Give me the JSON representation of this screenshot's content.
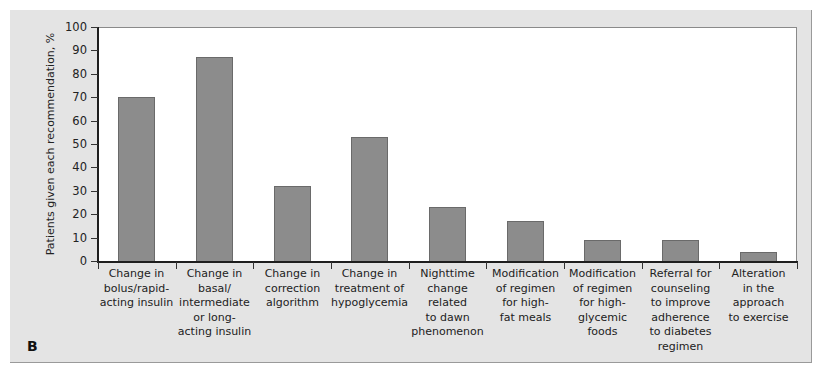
{
  "panel_label": "B",
  "chart_data": {
    "type": "bar",
    "title": "",
    "xlabel": "",
    "ylabel": "Patients given each recommendation, %",
    "ylim": [
      0,
      100
    ],
    "yticks": [
      0,
      10,
      20,
      30,
      40,
      50,
      60,
      70,
      80,
      90,
      100
    ],
    "grid": false,
    "legend": null,
    "bar_color": "#8c8c8c",
    "categories": [
      "Change in\nbolus/rapid-\nacting insulin",
      "Change in\nbasal/\nintermediate\nor long-\nacting insulin",
      "Change in\ncorrection\nalgorithm",
      "Change in\ntreatment of\nhypoglycemia",
      "Nighttime\nchange\nrelated\nto dawn\nphenomenon",
      "Modification\nof regimen\nfor high-\nfat meals",
      "Modification\nof regimen\nfor high-\nglycemic\nfoods",
      "Referral for\ncounseling\nto improve\nadherence\nto diabetes\nregimen",
      "Alteration\nin the\napproach\nto exercise"
    ],
    "values": [
      70,
      87,
      32,
      53,
      23,
      17,
      9,
      9,
      4
    ]
  }
}
